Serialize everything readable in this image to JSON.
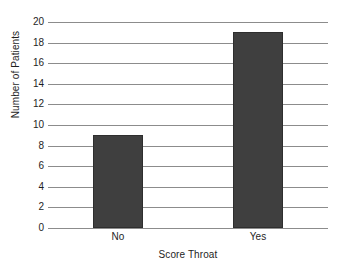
{
  "chart_data": {
    "type": "bar",
    "title": "",
    "xlabel": "Score Throat",
    "ylabel": "Number of Patients",
    "categories": [
      "No",
      "Yes"
    ],
    "values": [
      9,
      19
    ],
    "series": [
      {
        "name": "Number of Patients",
        "values": [
          9,
          19
        ]
      }
    ],
    "ylim": [
      0,
      20
    ],
    "ytick_labels": [
      "0",
      "2",
      "4",
      "6",
      "8",
      "10",
      "12",
      "14",
      "16",
      "18",
      "20"
    ],
    "ytick_values": [
      0,
      2,
      4,
      6,
      8,
      10,
      12,
      14,
      16,
      18,
      20
    ],
    "grid": "horizontal",
    "legend": "none",
    "colors": {
      "bar": "#3f3f3f",
      "bar_edge": "#2e2e2e",
      "gridline": "#8c8c8c",
      "text": "#1e1e1e",
      "background": "#ffffff"
    }
  }
}
